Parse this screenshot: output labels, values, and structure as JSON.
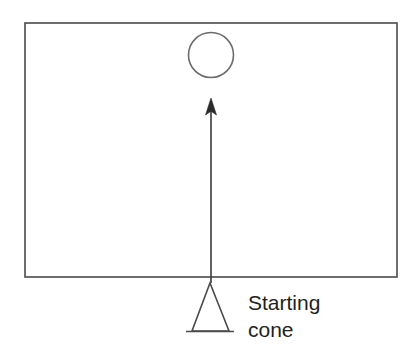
{
  "figure": {
    "background_color": "#ffffff",
    "line_color": "#4a4a4a",
    "arrow_color": "#2b2b2b",
    "text_color": "#231f20",
    "field": {
      "name": "field-boundary-rectangle",
      "x": 25,
      "y": 23,
      "width": 372,
      "height": 254,
      "stroke_width": 1.6
    },
    "target": {
      "name": "target-circle",
      "cx": 211,
      "cy": 55,
      "r": 22.5,
      "stroke_width": 1.6
    },
    "path_arrow": {
      "name": "movement-path-arrow",
      "x": 211,
      "start_y": 283,
      "end_y": 98,
      "shaft_width": 1.6,
      "head_width": 11,
      "head_height": 17,
      "direction": "up"
    },
    "cone": {
      "name": "starting-cone",
      "apex_x": 210,
      "apex_y": 283,
      "left_x": 192,
      "right_x": 229,
      "base_y": 331,
      "base_line_x1": 186,
      "base_line_x2": 234,
      "stroke_width": 1.6
    },
    "labels": {
      "cone_label_line1": "Starting",
      "cone_label_line2": "cone",
      "cone_label_x": 248,
      "cone_label_line1_y": 310,
      "cone_label_line2_y": 337,
      "font_size": 21
    }
  }
}
